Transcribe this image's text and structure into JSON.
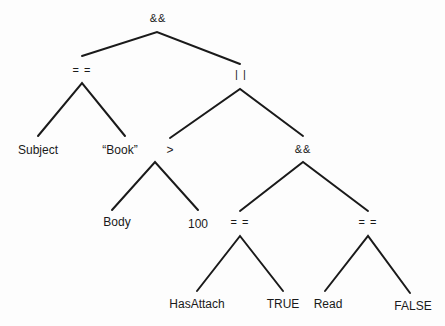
{
  "diagram": {
    "type": "expression-tree",
    "nodes": {
      "root": {
        "label": "&&"
      },
      "eq1": {
        "label": "= ="
      },
      "or1": {
        "label": "| |"
      },
      "subject": {
        "label": "Subject"
      },
      "book": {
        "label": "“Book”"
      },
      "gt": {
        "label": ">"
      },
      "and2": {
        "label": "&&"
      },
      "body": {
        "label": "Body"
      },
      "hundred": {
        "label": "100"
      },
      "eq2": {
        "label": "= ="
      },
      "eq3": {
        "label": "= ="
      },
      "hasattach": {
        "label": "HasAttach"
      },
      "true": {
        "label": "TRUE"
      },
      "read": {
        "label": "Read"
      },
      "false": {
        "label": "FALSE"
      }
    },
    "edges": [
      [
        "root",
        "eq1"
      ],
      [
        "root",
        "or1"
      ],
      [
        "eq1",
        "subject"
      ],
      [
        "eq1",
        "book"
      ],
      [
        "or1",
        "gt"
      ],
      [
        "or1",
        "and2"
      ],
      [
        "gt",
        "body"
      ],
      [
        "gt",
        "hundred"
      ],
      [
        "and2",
        "eq2"
      ],
      [
        "and2",
        "eq3"
      ],
      [
        "eq2",
        "hasattach"
      ],
      [
        "eq2",
        "true"
      ],
      [
        "eq3",
        "read"
      ],
      [
        "eq3",
        "false"
      ]
    ],
    "line_color": "#1a1a1a"
  }
}
